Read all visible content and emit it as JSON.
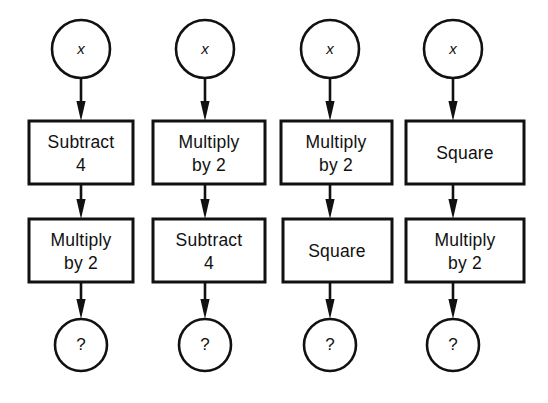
{
  "diagram": {
    "background_color": "#ffffff",
    "stroke_color": "#111111",
    "input_label": "x",
    "output_label": "?",
    "arrow_icon_name": "down-arrow-icon",
    "columns": [
      {
        "id": "chain-1",
        "input": "x",
        "steps": [
          {
            "line1": "Subtract",
            "line2": "4"
          },
          {
            "line1": "Multiply",
            "line2": "by 2"
          }
        ],
        "output": "?"
      },
      {
        "id": "chain-2",
        "input": "x",
        "steps": [
          {
            "line1": "Multiply",
            "line2": "by 2"
          },
          {
            "line1": "Subtract",
            "line2": "4"
          }
        ],
        "output": "?"
      },
      {
        "id": "chain-3",
        "input": "x",
        "steps": [
          {
            "line1": "Multiply",
            "line2": "by 2"
          },
          {
            "line1": "Square",
            "line2": ""
          }
        ],
        "output": "?"
      },
      {
        "id": "chain-4",
        "input": "x",
        "steps": [
          {
            "line1": "Square",
            "line2": ""
          },
          {
            "line1": "Multiply",
            "line2": "by 2"
          }
        ],
        "output": "?"
      }
    ]
  }
}
